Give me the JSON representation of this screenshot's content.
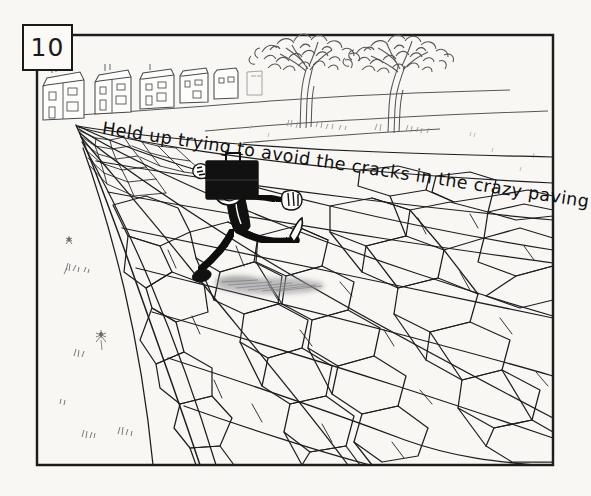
{
  "panel": {
    "number": "10",
    "caption": "Held up trying to avoid the cracks in the crazy paving"
  },
  "artwork": {
    "medium_description": "pen-and-ink cartoon drawing on off-white paper",
    "frame": {
      "left": 37,
      "top": 35,
      "right": 553,
      "bottom": 465,
      "stroke": "#1a1a1a"
    },
    "colors": {
      "paper": "#f8f7f4",
      "ink": "#1a1a1a",
      "pencil_light": "#6f6f6f",
      "shadow_grey": "#9a9a9a"
    },
    "scene_elements": [
      {
        "name": "panel-number-box",
        "label": "10"
      },
      {
        "name": "row-of-houses",
        "label": "row of terraced houses on the horizon, left side",
        "count": 5
      },
      {
        "name": "tree-left",
        "label": "bare-branched tree with leafy canopy"
      },
      {
        "name": "tree-right",
        "label": "bare-branched tree with leafy canopy"
      },
      {
        "name": "horizon-line",
        "label": "sloping horizon / pavement edge"
      },
      {
        "name": "crazy-paving",
        "label": "field of irregular cracked paving slabs in perspective"
      },
      {
        "name": "businessman-figure",
        "label": "man in suit balancing on one foot, arms outstretched"
      },
      {
        "name": "briefcase",
        "label": "black briefcase held above the man's head"
      },
      {
        "name": "figure-shadow",
        "label": "grey smudged shadow beneath the figure"
      },
      {
        "name": "grass-tufts",
        "label": "small sketched grass and flower marks on the blank verge"
      }
    ]
  }
}
